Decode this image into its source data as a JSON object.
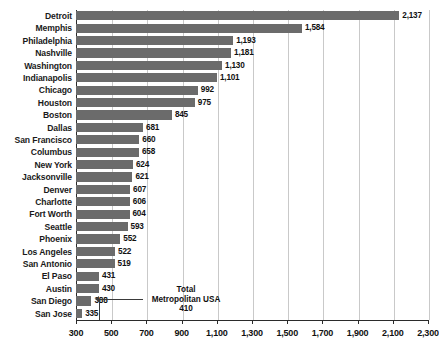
{
  "chart_data": {
    "type": "bar",
    "orientation": "horizontal",
    "title": "",
    "subtitle": "",
    "xlabel": "",
    "ylabel": "",
    "xlim": [
      300,
      2300
    ],
    "xtick_step": 200,
    "xticks": [
      "300",
      "500",
      "700",
      "900",
      "1,100",
      "1,300",
      "1,500",
      "1,700",
      "1,900",
      "2,100",
      "2,300"
    ],
    "xtick_values": [
      300,
      500,
      700,
      900,
      1100,
      1300,
      1500,
      1700,
      1900,
      2100,
      2300
    ],
    "grid": "vertical",
    "legend": "none",
    "bar_color": "#6b6b6b",
    "categories": [
      "Detroit",
      "Memphis",
      "Philadelphia",
      "Nashville",
      "Washington",
      "Indianapolis",
      "Chicago",
      "Houston",
      "Boston",
      "Dallas",
      "San Francisco",
      "Columbus",
      "New York",
      "Jacksonville",
      "Denver",
      "Charlotte",
      "Fort Worth",
      "Seattle",
      "Phoenix",
      "Los Angeles",
      "San Antonio",
      "El Paso",
      "Austin",
      "San Diego",
      "San Jose"
    ],
    "values": [
      2137,
      1584,
      1193,
      1181,
      1130,
      1101,
      992,
      975,
      845,
      681,
      660,
      658,
      624,
      621,
      607,
      606,
      604,
      593,
      552,
      522,
      519,
      431,
      430,
      388,
      335
    ],
    "value_labels": [
      "2,137",
      "1,584",
      "1,193",
      "1,181",
      "1,130",
      "1,101",
      "992",
      "975",
      "845",
      "681",
      "660",
      "658",
      "624",
      "621",
      "607",
      "606",
      "604",
      "593",
      "552",
      "522",
      "519",
      "431",
      "430",
      "388",
      "335"
    ],
    "annotations": [
      {
        "name": "total-metropolitan-usa",
        "line1": "Total",
        "line2": "Metropolitan USA",
        "line3": "410",
        "value": 410
      }
    ]
  }
}
